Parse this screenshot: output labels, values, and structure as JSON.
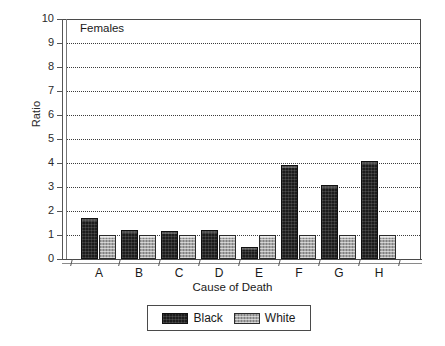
{
  "chart_data": {
    "type": "bar",
    "title": "",
    "annotation": "Females",
    "xlabel": "Cause of Death",
    "ylabel": "Ratio",
    "categories": [
      "A",
      "B",
      "C",
      "D",
      "E",
      "F",
      "G",
      "H"
    ],
    "series": [
      {
        "name": "Black",
        "color": "#1c1c1c",
        "values": [
          1.7,
          1.2,
          1.15,
          1.2,
          0.5,
          3.9,
          3.1,
          4.1
        ]
      },
      {
        "name": "White",
        "color": "#a6a6a6",
        "values": [
          1.0,
          1.0,
          1.0,
          1.0,
          1.0,
          1.0,
          1.0,
          1.0
        ]
      }
    ],
    "ylim": [
      0,
      10
    ],
    "yticks": [
      0,
      1,
      2,
      3,
      4,
      5,
      6,
      7,
      8,
      9,
      10
    ],
    "ytick_labels": [
      "0",
      "1",
      "2",
      "3",
      "4",
      "5",
      "6",
      "7",
      "8",
      "9",
      "10"
    ],
    "grid": true,
    "grid_style": "dotted",
    "legend_position": "bottom",
    "legend_entries": [
      "Black",
      "White"
    ]
  }
}
